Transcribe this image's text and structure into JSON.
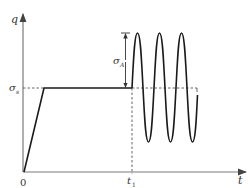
{
  "diagram": {
    "y_axis_label": "q",
    "x_axis_label": "t",
    "origin_label": "0",
    "sigma_s_label": "σ",
    "sigma_s_sub": "s",
    "sigma_a_label": "σ",
    "sigma_a_sub": "A",
    "t1_label": "t",
    "t1_sub": "1",
    "colors": {
      "axis": "#7a7a7a",
      "curve": "#1a1a1a",
      "dashed": "#555555",
      "text": "#333333"
    }
  }
}
